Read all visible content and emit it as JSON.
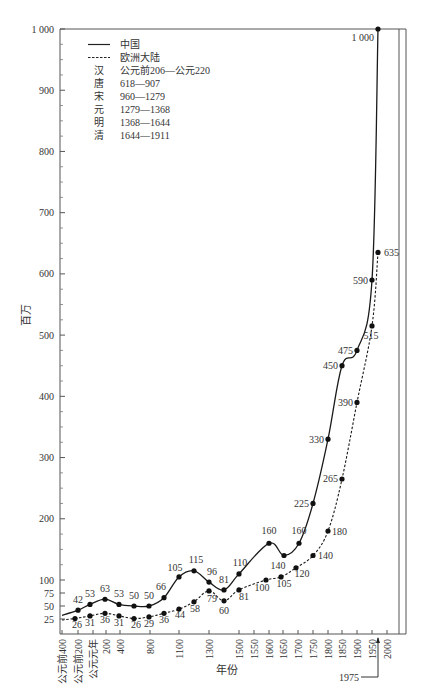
{
  "chart_data": {
    "type": "line",
    "title": "",
    "xlabel": "年份",
    "ylabel": "百万",
    "ylim": [
      0,
      1000
    ],
    "y_ticks": [
      {
        "value": 1000,
        "label": "1 000"
      },
      {
        "value": 900,
        "label": "900"
      },
      {
        "value": 800,
        "label": "800"
      },
      {
        "value": 700,
        "label": "700"
      },
      {
        "value": 600,
        "label": "600"
      },
      {
        "value": 500,
        "label": "500"
      },
      {
        "value": 400,
        "label": "400"
      },
      {
        "value": 300,
        "label": "300"
      },
      {
        "value": 200,
        "label": "200"
      },
      {
        "value": 100,
        "label": "100"
      },
      {
        "value": 75,
        "label": "75"
      },
      {
        "value": 50,
        "label": "50"
      },
      {
        "value": 25,
        "label": "25"
      }
    ],
    "x_ticks": [
      {
        "label": "公元前400",
        "x": 62
      },
      {
        "label": "公元前200",
        "x": 78
      },
      {
        "label": "公元元年",
        "x": 93
      },
      {
        "label": "200",
        "x": 106
      },
      {
        "label": "400",
        "x": 120
      },
      {
        "label": "800",
        "x": 150
      },
      {
        "label": "1100",
        "x": 179
      },
      {
        "label": "1300",
        "x": 209
      },
      {
        "label": "1500",
        "x": 239
      },
      {
        "label": "1550",
        "x": 254
      },
      {
        "label": "1600",
        "x": 269
      },
      {
        "label": "1650",
        "x": 283
      },
      {
        "label": "1700",
        "x": 298
      },
      {
        "label": "1750",
        "x": 313
      },
      {
        "label": "1800",
        "x": 328
      },
      {
        "label": "1850",
        "x": 342
      },
      {
        "label": "1900",
        "x": 357
      },
      {
        "label": "1950",
        "x": 372
      },
      {
        "label": "2000",
        "x": 387
      }
    ],
    "annotation": {
      "label": "1975",
      "x": 378
    },
    "legend": {
      "position": "upper-left",
      "series_entries": [
        {
          "style": "solid",
          "label": "中国"
        },
        {
          "style": "dashed",
          "label": "欧洲大陆"
        }
      ],
      "dynasties": [
        {
          "name": "汉",
          "period": "公元前206—公元220"
        },
        {
          "name": "唐",
          "period": "618—907"
        },
        {
          "name": "宋",
          "period": "960—1279"
        },
        {
          "name": "元",
          "period": "1279—1368"
        },
        {
          "name": "明",
          "period": "1368—1644"
        },
        {
          "name": "清",
          "period": "1644—1911"
        }
      ]
    },
    "grid": false,
    "series": [
      {
        "name": "中国",
        "style": "solid",
        "points": [
          {
            "x": 62,
            "year": "公元前400",
            "value": 32,
            "label": ""
          },
          {
            "x": 78,
            "year": "公元前200",
            "value": 42,
            "label": "42"
          },
          {
            "x": 90,
            "year": "公元元年",
            "value": 53,
            "label": "53"
          },
          {
            "x": 105,
            "year": "200",
            "value": 63,
            "label": "63"
          },
          {
            "x": 119,
            "year": "400",
            "value": 53,
            "label": "53"
          },
          {
            "x": 134,
            "year": "600",
            "value": 50,
            "label": "50"
          },
          {
            "x": 149,
            "year": "800",
            "value": 50,
            "label": "50"
          },
          {
            "x": 164,
            "year": "1000",
            "value": 66,
            "label": "66"
          },
          {
            "x": 179,
            "year": "1100",
            "value": 105,
            "label": "105"
          },
          {
            "x": 194,
            "year": "1200",
            "value": 115,
            "label": "115"
          },
          {
            "x": 209,
            "year": "1300",
            "value": 96,
            "label": "96"
          },
          {
            "x": 224,
            "year": "1400",
            "value": 81,
            "label": "81"
          },
          {
            "x": 239,
            "year": "1500",
            "value": 110,
            "label": "110"
          },
          {
            "x": 269,
            "year": "1600",
            "value": 160,
            "label": "160"
          },
          {
            "x": 284,
            "year": "1650",
            "value": 140,
            "label": "140"
          },
          {
            "x": 299,
            "year": "1700",
            "value": 160,
            "label": "160"
          },
          {
            "x": 313,
            "year": "1750",
            "value": 225,
            "label": "225"
          },
          {
            "x": 328,
            "year": "1800",
            "value": 330,
            "label": "330"
          },
          {
            "x": 342,
            "year": "1850",
            "value": 450,
            "label": "450"
          },
          {
            "x": 357,
            "year": "1900",
            "value": 475,
            "label": "475"
          },
          {
            "x": 372,
            "year": "1950",
            "value": 590,
            "label": "590"
          },
          {
            "x": 378,
            "year": "1975",
            "value": 1000,
            "label": "1 000"
          }
        ]
      },
      {
        "name": "欧洲大陆",
        "style": "dashed",
        "points": [
          {
            "x": 62,
            "year": "公元前400",
            "value": 23,
            "label": ""
          },
          {
            "x": 75,
            "year": "公元前200",
            "value": 26,
            "label": "26"
          },
          {
            "x": 90,
            "year": "公元元年",
            "value": 31,
            "label": "31"
          },
          {
            "x": 105,
            "year": "200",
            "value": 36,
            "label": "36"
          },
          {
            "x": 119,
            "year": "400",
            "value": 31,
            "label": "31"
          },
          {
            "x": 134,
            "year": "600",
            "value": 26,
            "label": "26"
          },
          {
            "x": 149,
            "year": "800",
            "value": 29,
            "label": "29"
          },
          {
            "x": 164,
            "year": "1000",
            "value": 36,
            "label": "36"
          },
          {
            "x": 179,
            "year": "1100",
            "value": 44,
            "label": "44"
          },
          {
            "x": 194,
            "year": "1200",
            "value": 58,
            "label": "58"
          },
          {
            "x": 209,
            "year": "1300",
            "value": 79,
            "label": "79"
          },
          {
            "x": 224,
            "year": "1400",
            "value": 60,
            "label": "60"
          },
          {
            "x": 239,
            "year": "1500",
            "value": 81,
            "label": "81"
          },
          {
            "x": 266,
            "year": "1600",
            "value": 100,
            "label": "100"
          },
          {
            "x": 281,
            "year": "1650",
            "value": 105,
            "label": "105"
          },
          {
            "x": 296,
            "year": "1700",
            "value": 120,
            "label": "120"
          },
          {
            "x": 313,
            "year": "1750",
            "value": 140,
            "label": "140"
          },
          {
            "x": 328,
            "year": "1800",
            "value": 180,
            "label": "180"
          },
          {
            "x": 342,
            "year": "1850",
            "value": 265,
            "label": "265"
          },
          {
            "x": 357,
            "year": "1900",
            "value": 390,
            "label": "390"
          },
          {
            "x": 372,
            "year": "1950",
            "value": 515,
            "label": "515"
          },
          {
            "x": 378,
            "year": "1975",
            "value": 635,
            "label": "635"
          }
        ]
      }
    ]
  }
}
